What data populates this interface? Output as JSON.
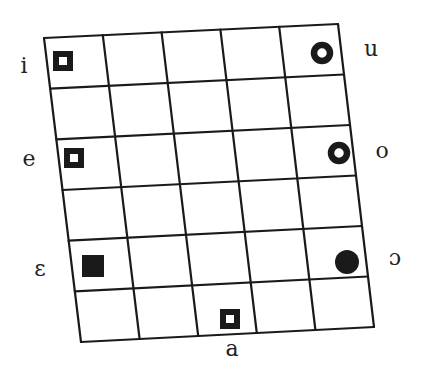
{
  "diagram": {
    "type": "vowel-chart-grid",
    "columns": 5,
    "rows": 6,
    "corners": {
      "top_left": [
        44,
        38
      ],
      "top_right": [
        338,
        24
      ],
      "bottom_left": [
        81,
        342
      ],
      "bottom_right": [
        374,
        327
      ]
    },
    "line_color": "#1a1a1a",
    "marker_color": "#1a1a1a"
  },
  "vowels": [
    {
      "symbol": "i",
      "marker": "hollow-square",
      "marker_pos": [
        63,
        61
      ],
      "label_pos": [
        24,
        73
      ]
    },
    {
      "symbol": "u",
      "marker": "ring",
      "marker_pos": [
        322,
        53
      ],
      "label_pos": [
        371,
        56
      ]
    },
    {
      "symbol": "e",
      "marker": "hollow-square",
      "marker_pos": [
        74,
        158
      ],
      "label_pos": [
        29,
        166
      ]
    },
    {
      "symbol": "o",
      "marker": "ring",
      "marker_pos": [
        339,
        153
      ],
      "label_pos": [
        382,
        158
      ]
    },
    {
      "symbol": "ɛ",
      "marker": "filled-square",
      "marker_pos": [
        93,
        266
      ],
      "label_pos": [
        40,
        276
      ]
    },
    {
      "symbol": "ɔ",
      "marker": "filled-circle",
      "marker_pos": [
        347,
        262
      ],
      "label_pos": [
        395,
        265
      ]
    },
    {
      "symbol": "a",
      "marker": "hollow-square",
      "marker_pos": [
        230,
        319
      ],
      "label_pos": [
        232,
        356
      ]
    }
  ]
}
